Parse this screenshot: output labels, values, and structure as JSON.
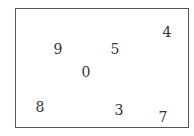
{
  "figure": {
    "digits": [
      {
        "id": "d4",
        "value": "4"
      },
      {
        "id": "d9",
        "value": "9"
      },
      {
        "id": "d5",
        "value": "5"
      },
      {
        "id": "d0",
        "value": "0"
      },
      {
        "id": "d8",
        "value": "8"
      },
      {
        "id": "d3",
        "value": "3"
      },
      {
        "id": "d7",
        "value": "7"
      }
    ]
  }
}
